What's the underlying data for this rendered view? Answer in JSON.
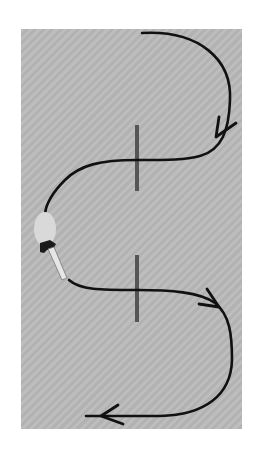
{
  "diagram": {
    "colors": {
      "background": "#ffffff",
      "panel": "#b9b9b9",
      "path": "#111111",
      "marker": "#555555",
      "object_body": "#d9d9d9",
      "object_cap": "#1a1a1a",
      "object_tube": "#e6e6e6"
    },
    "elements": {
      "upper_path": {
        "label": "upper-path",
        "direction": "clockwise-down-then-left",
        "arrow_count": 1
      },
      "lower_path": {
        "label": "lower-path",
        "direction": "right-then-down-then-left",
        "arrow_count": 2
      },
      "markers": [
        {
          "label": "marker-upper",
          "x": 137,
          "y1": 125,
          "y2": 191
        },
        {
          "label": "marker-lower",
          "x": 137,
          "y1": 255,
          "y2": 322
        }
      ],
      "object": {
        "label": "object",
        "position": "left-middle"
      }
    },
    "text": []
  }
}
